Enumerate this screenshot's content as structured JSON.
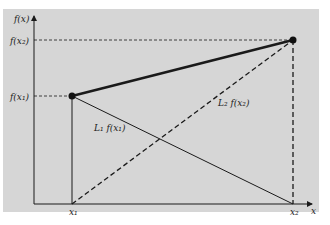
{
  "diagram": {
    "type": "linear-interpolation",
    "background_color": "#d6d6d6",
    "line_color": "#1a1a1a",
    "y_axis_label": "f(x)",
    "x_axis_label": "x",
    "points": [
      {
        "x_label": "x₁",
        "y_label": "f(x₁)",
        "px": 72,
        "py": 96
      },
      {
        "x_label": "x₂",
        "y_label": "f(x₂)",
        "px": 293,
        "py": 40
      }
    ],
    "line_labels": {
      "L1": "L₁ f(x₁)",
      "L2": "L₂ f(x₂)"
    },
    "tick_labels": {
      "f_x2": "f(x₂)",
      "f_x1": "f(x₁)",
      "x1": "x₁",
      "x2": "x₂"
    }
  }
}
